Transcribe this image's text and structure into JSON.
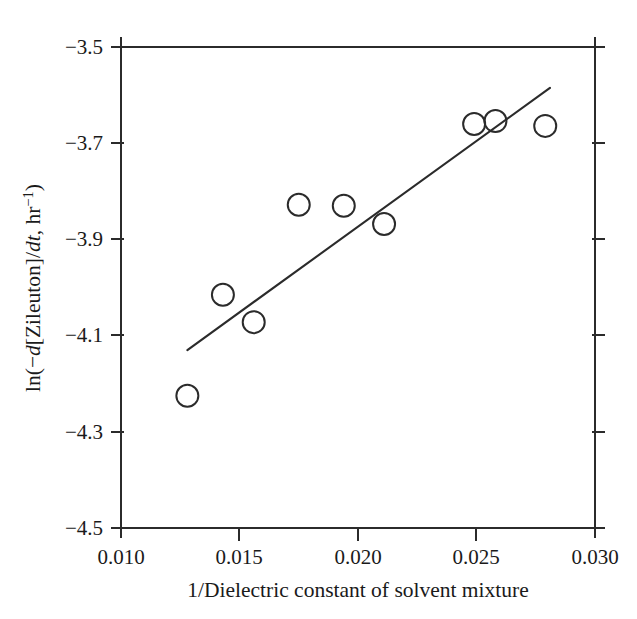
{
  "chart_data": {
    "type": "scatter",
    "title": "",
    "subtitle": "",
    "xlabel": "1/Dielectric constant of solvent mixture",
    "ylabel": "ln(−d[Zileuton]/dt, hr⁻¹)",
    "ylabel_parts": {
      "pre": "ln(−",
      "italic1": "d",
      "mid": "[Zileuton]/",
      "italic2": "dt",
      "post": ", hr",
      "superscript": "−1",
      "tail": ")"
    },
    "xlim": [
      0.01,
      0.03
    ],
    "ylim": [
      -4.5,
      -3.5
    ],
    "xticks": [
      0.01,
      0.015,
      0.02,
      0.025,
      0.03
    ],
    "xtick_labels": [
      "0.010",
      "0.015",
      "0.020",
      "0.025",
      "0.030"
    ],
    "yticks": [
      -3.5,
      -3.7,
      -3.9,
      -4.1,
      -4.3,
      -4.5
    ],
    "ytick_labels": [
      "−3.5",
      "−3.7",
      "−3.9",
      "−4.1",
      "−4.3",
      "−4.5"
    ],
    "grid": false,
    "legend": null,
    "legend_position": "none",
    "marker": "open-circle",
    "marker_radius_px": 11,
    "series": [
      {
        "name": "Zileuton degradation rate",
        "marker": "open-circle",
        "points": [
          {
            "x": 0.0128,
            "y": -4.225
          },
          {
            "x": 0.0143,
            "y": -4.015
          },
          {
            "x": 0.0156,
            "y": -4.072
          },
          {
            "x": 0.0175,
            "y": -3.828
          },
          {
            "x": 0.0194,
            "y": -3.83
          },
          {
            "x": 0.0211,
            "y": -3.868
          },
          {
            "x": 0.0249,
            "y": -3.66
          },
          {
            "x": 0.0258,
            "y": -3.654
          },
          {
            "x": 0.0279,
            "y": -3.664
          }
        ]
      }
    ],
    "fit_line": {
      "name": "linear regression",
      "x_start": 0.0128,
      "y_start": -4.13,
      "x_end": 0.0281,
      "y_end": -3.585
    },
    "colors": {
      "axis": "#2b2b2b",
      "marker_stroke": "#2b2b2b",
      "line": "#2b2b2b",
      "background": "#ffffff",
      "text": "#1a1a1a"
    }
  }
}
